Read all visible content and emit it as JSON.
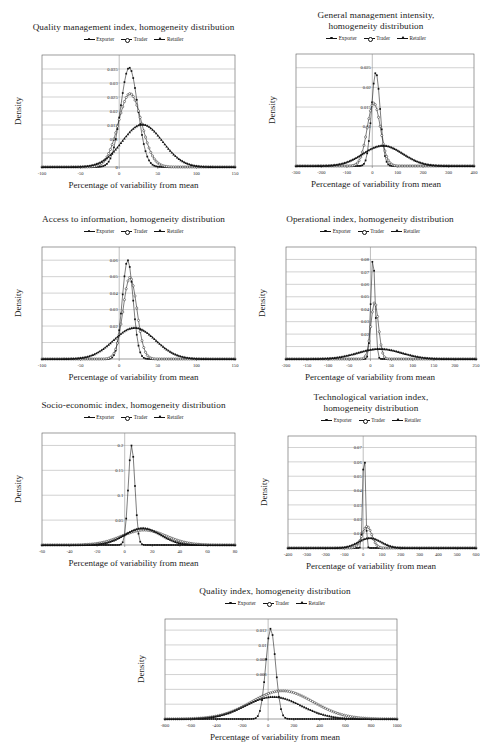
{
  "figure": {
    "axis_label_x": "Percentage of variability from mean",
    "axis_label_y": "Density",
    "legend": [
      {
        "label": "Exporter",
        "marker": "dot"
      },
      {
        "label": "Trader",
        "marker": "circ"
      },
      {
        "label": "Retailer",
        "marker": "tri"
      }
    ]
  },
  "chart_data": [
    {
      "id": "quality-management-index",
      "type": "line",
      "title": "Quality management index, homogeneity distribution",
      "xlabel": "Percentage of variability from mean",
      "ylabel": "Density",
      "xlim": [
        -100,
        150
      ],
      "xticks": [
        -100,
        -50,
        0,
        50,
        100,
        150
      ],
      "ylim": [
        0,
        0.04
      ],
      "yticks": [
        0,
        0.005,
        0.01,
        0.015,
        0.02,
        0.025,
        0.03,
        0.035
      ],
      "yticklabels": [
        "0",
        "",
        "0.01",
        "0.015",
        "0.02",
        "0.025",
        "0.03",
        "0.035"
      ],
      "grid": true,
      "series": [
        {
          "name": "Exporter",
          "marker": "dot",
          "mean": 13,
          "sd": 11,
          "peak": 0.0355
        },
        {
          "name": "Trader",
          "marker": "circ",
          "mean": 14,
          "sd": 15,
          "peak": 0.0262
        },
        {
          "name": "Retailer",
          "marker": "tri",
          "mean": 30,
          "sd": 26,
          "peak": 0.0152
        }
      ]
    },
    {
      "id": "general-management-intensity",
      "type": "line",
      "title": "General management intensity,\nhomogeneity distribution",
      "xlabel": "Percentage of variability from mean",
      "ylabel": "Density",
      "xlim": [
        -300,
        400
      ],
      "xticks": [
        -300,
        -200,
        -100,
        0,
        100,
        200,
        300,
        400
      ],
      "ylim": [
        0,
        0.0285
      ],
      "yticks": [
        0,
        0.005,
        0.01,
        0.015,
        0.02,
        0.025
      ],
      "yticklabels": [
        "",
        "",
        "0.01",
        "0.015",
        "0.02",
        "0.025"
      ],
      "grid": true,
      "series": [
        {
          "name": "Exporter",
          "marker": "dot",
          "mean": 14,
          "sd": 17,
          "peak": 0.0238
        },
        {
          "name": "Trader",
          "marker": "circ",
          "mean": 6,
          "sd": 26,
          "peak": 0.016
        },
        {
          "name": "Retailer",
          "marker": "tri",
          "mean": 42,
          "sd": 78,
          "peak": 0.0052
        }
      ]
    },
    {
      "id": "access-to-information",
      "type": "line",
      "title": "Access to information, homogeneity distribution",
      "xlabel": "Percentage of variability from mean",
      "ylabel": "Density",
      "xlim": [
        -100,
        150
      ],
      "xticks": [
        -100,
        -50,
        0,
        50,
        100,
        150
      ],
      "ylim": [
        0,
        0.068
      ],
      "yticks": [
        0,
        0.01,
        0.02,
        0.03,
        0.04,
        0.05,
        0.06
      ],
      "yticklabels": [
        "",
        "",
        "0.02",
        "0.03",
        "0.04",
        "0.05",
        "0.06"
      ],
      "grid": true,
      "series": [
        {
          "name": "Exporter",
          "marker": "dot",
          "mean": 11,
          "sd": 7,
          "peak": 0.06
        },
        {
          "name": "Trader",
          "marker": "circ",
          "mean": 14,
          "sd": 9,
          "peak": 0.0495
        },
        {
          "name": "Retailer",
          "marker": "tri",
          "mean": 20,
          "sd": 27,
          "peak": 0.019
        }
      ]
    },
    {
      "id": "operational-index",
      "type": "line",
      "title": "Operational index, homogeneity distribution",
      "xlabel": "Percentage of variability from mean",
      "ylabel": "Density",
      "xlim": [
        -200,
        250
      ],
      "xticks": [
        -200,
        -150,
        -100,
        -50,
        0,
        50,
        100,
        150,
        200,
        250
      ],
      "ylim": [
        0,
        0.09
      ],
      "yticks": [
        0,
        0.01,
        0.02,
        0.03,
        0.04,
        0.05,
        0.06,
        0.07,
        0.08
      ],
      "yticklabels": [
        "",
        "",
        "0.02",
        "0.03",
        "0.04",
        "0.05",
        "0.06",
        "0.07",
        "0.08"
      ],
      "grid": true,
      "series": [
        {
          "name": "Exporter",
          "marker": "dot",
          "mean": 6,
          "sd": 5,
          "peak": 0.0815
        },
        {
          "name": "Trader",
          "marker": "circ",
          "mean": 10,
          "sd": 9,
          "peak": 0.0455
        },
        {
          "name": "Retailer",
          "marker": "tri",
          "mean": 22,
          "sd": 52,
          "peak": 0.0082
        }
      ]
    },
    {
      "id": "socio-economic-index",
      "type": "line",
      "title": "Socio-economic index, homogeneity distribution",
      "xlabel": "Percentage of variability from mean",
      "ylabel": "Density",
      "xlim": [
        -60,
        80
      ],
      "xticks": [
        -60,
        -40,
        -20,
        0,
        20,
        40,
        60,
        80
      ],
      "ylim": [
        0,
        0.225
      ],
      "yticks": [
        0,
        0.05,
        0.1,
        0.15,
        0.2
      ],
      "yticklabels": [
        "",
        "0.05",
        "0.1",
        "0.15",
        "0.2"
      ],
      "grid": true,
      "series": [
        {
          "name": "Exporter",
          "marker": "dot",
          "mean": 5,
          "sd": 2.4,
          "peak": 0.2
        },
        {
          "name": "Trader",
          "marker": "circ",
          "mean": 14,
          "sd": 16,
          "peak": 0.03
        },
        {
          "name": "Retailer",
          "marker": "tri",
          "mean": 13,
          "sd": 13,
          "peak": 0.034
        }
      ]
    },
    {
      "id": "technological-variation-index",
      "type": "line",
      "title": "Technological variation index,\nhomogeneity distribution",
      "xlabel": "Percentage of variability from mean",
      "ylabel": "Density",
      "xlim": [
        -400,
        600
      ],
      "xticks": [
        -400,
        -300,
        -200,
        -100,
        0,
        100,
        200,
        300,
        400,
        500,
        600
      ],
      "ylim": [
        0,
        0.078
      ],
      "yticks": [
        0,
        0.01,
        0.02,
        0.03,
        0.04,
        0.05,
        0.06,
        0.07
      ],
      "yticklabels": [
        "",
        "0.01",
        "0.02",
        "0.03",
        "0.04",
        "0.05",
        "0.06",
        "0.07"
      ],
      "grid": true,
      "series": [
        {
          "name": "Exporter",
          "marker": "dot",
          "mean": 5,
          "sd": 7,
          "peak": 0.0705
        },
        {
          "name": "Trader",
          "marker": "circ",
          "mean": 20,
          "sd": 26,
          "peak": 0.015
        },
        {
          "name": "Retailer",
          "marker": "tri",
          "mean": 35,
          "sd": 60,
          "peak": 0.007
        }
      ]
    },
    {
      "id": "quality-index",
      "type": "line",
      "title": "Quality index, homogeneity distribution",
      "xlabel": "Percentage of variability from mean",
      "ylabel": "Density",
      "xlim": [
        -800,
        1000
      ],
      "xticks": [
        -800,
        -600,
        -400,
        -200,
        0,
        200,
        400,
        600,
        800,
        1000
      ],
      "ylim": [
        0,
        0.0135
      ],
      "yticks": [
        0,
        0.002,
        0.004,
        0.006,
        0.008,
        0.01,
        0.012
      ],
      "yticklabels": [
        "",
        "",
        "",
        "0.006",
        "0.008",
        "0.01",
        "0.012"
      ],
      "grid": true,
      "series": [
        {
          "name": "Exporter",
          "marker": "dot",
          "mean": 20,
          "sd": 38,
          "peak": 0.0122
        },
        {
          "name": "Trader",
          "marker": "circ",
          "mean": 110,
          "sd": 240,
          "peak": 0.0038
        },
        {
          "name": "Retailer",
          "marker": "tri",
          "mean": 40,
          "sd": 215,
          "peak": 0.003
        }
      ]
    }
  ],
  "layout": {
    "panels": [
      {
        "id": "quality-management-index",
        "left": 6,
        "top": 22,
        "width": 255,
        "height": 180,
        "plot_w": 193,
        "plot_h": 112,
        "plot_left": 36
      },
      {
        "id": "general-management-intensity",
        "left": 272,
        "top": 10,
        "width": 208,
        "height": 192,
        "plot_w": 178,
        "plot_h": 112,
        "plot_left": 24
      },
      {
        "id": "access-to-information",
        "left": 6,
        "top": 214,
        "width": 255,
        "height": 180,
        "plot_w": 193,
        "plot_h": 112,
        "plot_left": 36
      },
      {
        "id": "operational-index",
        "left": 260,
        "top": 214,
        "width": 220,
        "height": 180,
        "plot_w": 190,
        "plot_h": 112,
        "plot_left": 26
      },
      {
        "id": "socio-economic-index",
        "left": 6,
        "top": 400,
        "width": 255,
        "height": 180,
        "plot_w": 193,
        "plot_h": 112,
        "plot_left": 36
      },
      {
        "id": "technological-variation-index",
        "left": 262,
        "top": 392,
        "width": 218,
        "height": 192,
        "plot_w": 188,
        "plot_h": 112,
        "plot_left": 26
      },
      {
        "id": "quality-index",
        "left": 125,
        "top": 586,
        "width": 300,
        "height": 162,
        "plot_w": 232,
        "plot_h": 100,
        "plot_left": 40
      }
    ]
  }
}
